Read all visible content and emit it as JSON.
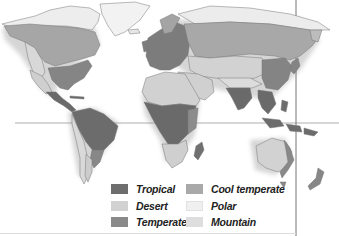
{
  "map": {
    "title": "World climate zones",
    "style": "grayscale",
    "reference_lines": [
      "equator",
      "vertical-frame-line"
    ]
  },
  "legend": {
    "items": [
      {
        "label": "Tropical",
        "color": "#6e6e6e"
      },
      {
        "label": "Desert",
        "color": "#d2d2d2"
      },
      {
        "label": "Temperate",
        "color": "#8a8a8a"
      },
      {
        "label": "Cool temperate",
        "color": "#a9a9a9"
      },
      {
        "label": "Polar",
        "color": "#f0f0f0"
      },
      {
        "label": "Mountain",
        "color": "#dedede"
      }
    ]
  },
  "regions": [
    {
      "name": "north-america-polar",
      "zone": "Polar"
    },
    {
      "name": "north-america-cool",
      "zone": "Cool temperate"
    },
    {
      "name": "north-america-temperate",
      "zone": "Temperate"
    },
    {
      "name": "north-america-mountain",
      "zone": "Mountain"
    },
    {
      "name": "north-america-desert",
      "zone": "Desert"
    },
    {
      "name": "greenland",
      "zone": "Polar"
    },
    {
      "name": "central-america",
      "zone": "Tropical"
    },
    {
      "name": "south-america-tropical",
      "zone": "Tropical"
    },
    {
      "name": "south-america-andes",
      "zone": "Mountain"
    },
    {
      "name": "south-america-temperate",
      "zone": "Temperate"
    },
    {
      "name": "europe",
      "zone": "Temperate"
    },
    {
      "name": "siberia",
      "zone": "Cool temperate"
    },
    {
      "name": "arctic-asia",
      "zone": "Polar"
    },
    {
      "name": "central-asia-desert",
      "zone": "Desert"
    },
    {
      "name": "himalaya",
      "zone": "Mountain"
    },
    {
      "name": "south-asia",
      "zone": "Tropical"
    },
    {
      "name": "east-asia",
      "zone": "Temperate"
    },
    {
      "name": "north-africa-desert",
      "zone": "Desert"
    },
    {
      "name": "central-africa",
      "zone": "Tropical"
    },
    {
      "name": "southern-africa",
      "zone": "Desert"
    },
    {
      "name": "madagascar",
      "zone": "Tropical"
    },
    {
      "name": "southeast-asia-islands",
      "zone": "Tropical"
    },
    {
      "name": "australia-interior",
      "zone": "Desert"
    },
    {
      "name": "australia-coast",
      "zone": "Temperate"
    },
    {
      "name": "new-zealand",
      "zone": "Temperate"
    }
  ]
}
